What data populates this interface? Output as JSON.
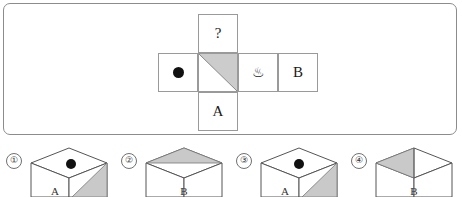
{
  "panel": {
    "border_color": "#8c8c8c",
    "background": "#ffffff"
  },
  "net": {
    "description": "cube-net-cross",
    "line_color": "#9a9a9a",
    "shade_color": "#cccccc",
    "cells": {
      "top": {
        "label": "?",
        "name": "unknown-face"
      },
      "left": {
        "label": "",
        "name": "dot-face",
        "icon": "black-dot"
      },
      "middle": {
        "label": "",
        "name": "triangle-face",
        "icon": "shaded-triangle"
      },
      "onsen": {
        "label": "♨",
        "name": "hot-spring-face",
        "icon": "hot-spring-icon"
      },
      "right": {
        "label": "B",
        "name": "b-face"
      },
      "bottom": {
        "label": "A",
        "name": "a-face"
      }
    }
  },
  "options": [
    {
      "number": "①",
      "name": "option-1",
      "top_face": "black-dot",
      "right_face": "shaded-triangle",
      "front_letter": "A"
    },
    {
      "number": "②",
      "name": "option-2",
      "top_face": "shaded-triangle-back-half",
      "right_face": "plain",
      "front_letter": "B"
    },
    {
      "number": "③",
      "name": "option-3",
      "top_face": "black-dot",
      "right_face": "shaded-triangle",
      "front_letter": "A"
    },
    {
      "number": "④",
      "name": "option-4",
      "top_face": "shaded-triangle-left-half",
      "right_face": "plain",
      "front_letter": "B"
    }
  ]
}
